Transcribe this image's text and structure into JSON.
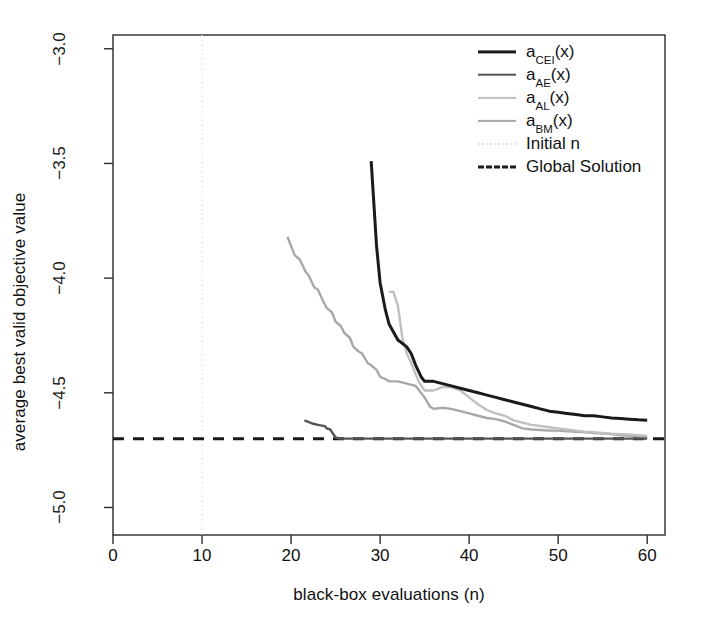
{
  "chart_data": {
    "type": "line",
    "title": "",
    "xlabel": "black-box evaluations (n)",
    "ylabel": "average best valid objective value",
    "xlim": [
      0,
      62
    ],
    "ylim": [
      -5.12,
      -2.94
    ],
    "xticks": [
      0,
      10,
      20,
      30,
      40,
      50,
      60
    ],
    "xtick_labels": [
      "0",
      "10",
      "20",
      "30",
      "40",
      "50",
      "60"
    ],
    "yticks": [
      -3.0,
      -3.5,
      -4.0,
      -4.5,
      -5.0
    ],
    "ytick_labels": [
      "-3.0",
      "-3.5",
      "-4.0",
      "-4.5",
      "-5.0"
    ],
    "grid": false,
    "legend_position": "top-right",
    "colors": {
      "cei": "#1a1a1a",
      "ae": "#555555",
      "al": "#c0c0c0",
      "bm": "#a8a8a8",
      "initial_n": "#e2e2e2",
      "global_solution": "#1a1a1a"
    },
    "annotations": {
      "initial_n_x": 10,
      "global_solution_y": -4.7
    },
    "series": [
      {
        "name": "a_CEI(x)",
        "label_main": "a",
        "label_sub": "CEI",
        "label_tail": "(x)",
        "color": "#1a1a1a",
        "width": 3,
        "dash": "none",
        "points": [
          [
            29,
            -3.49
          ],
          [
            29.6,
            -3.86
          ],
          [
            30,
            -4.02
          ],
          [
            30.6,
            -4.14
          ],
          [
            31,
            -4.2
          ],
          [
            32,
            -4.27
          ],
          [
            33,
            -4.3
          ],
          [
            33.5,
            -4.33
          ],
          [
            34,
            -4.38
          ],
          [
            34.6,
            -4.43
          ],
          [
            35,
            -4.45
          ],
          [
            36,
            -4.45
          ],
          [
            37,
            -4.46
          ],
          [
            38,
            -4.47
          ],
          [
            39,
            -4.48
          ],
          [
            40,
            -4.49
          ],
          [
            41,
            -4.5
          ],
          [
            42,
            -4.51
          ],
          [
            43,
            -4.52
          ],
          [
            44,
            -4.53
          ],
          [
            45,
            -4.54
          ],
          [
            46,
            -4.55
          ],
          [
            47,
            -4.56
          ],
          [
            48,
            -4.57
          ],
          [
            49,
            -4.58
          ],
          [
            50,
            -4.585
          ],
          [
            51,
            -4.59
          ],
          [
            52,
            -4.595
          ],
          [
            53,
            -4.6
          ],
          [
            54,
            -4.6
          ],
          [
            55,
            -4.605
          ],
          [
            56,
            -4.61
          ],
          [
            57,
            -4.612
          ],
          [
            58,
            -4.615
          ],
          [
            59,
            -4.618
          ],
          [
            60,
            -4.62
          ]
        ]
      },
      {
        "name": "a_AE(x)",
        "label_main": "a",
        "label_sub": "AE",
        "label_tail": "(x)",
        "color": "#555555",
        "width": 2.4,
        "dash": "none",
        "points": [
          [
            21.5,
            -4.62
          ],
          [
            22.5,
            -4.635
          ],
          [
            23,
            -4.64
          ],
          [
            23.8,
            -4.645
          ],
          [
            24,
            -4.655
          ],
          [
            24.4,
            -4.66
          ],
          [
            25,
            -4.695
          ],
          [
            25.5,
            -4.7
          ],
          [
            27,
            -4.7
          ],
          [
            30,
            -4.7
          ],
          [
            35,
            -4.7
          ],
          [
            40,
            -4.7
          ],
          [
            45,
            -4.7
          ],
          [
            50,
            -4.7
          ],
          [
            55,
            -4.7
          ],
          [
            60,
            -4.7
          ]
        ]
      },
      {
        "name": "a_AL(x)",
        "label_main": "a",
        "label_sub": "AL",
        "label_tail": "(x)",
        "color": "#c0c0c0",
        "width": 2.4,
        "dash": "none",
        "points": [
          [
            31,
            -4.06
          ],
          [
            31.5,
            -4.06
          ],
          [
            32,
            -4.12
          ],
          [
            32.5,
            -4.26
          ],
          [
            33,
            -4.33
          ],
          [
            33.5,
            -4.37
          ],
          [
            34,
            -4.42
          ],
          [
            34.4,
            -4.455
          ],
          [
            35,
            -4.49
          ],
          [
            36,
            -4.49
          ],
          [
            37,
            -4.475
          ],
          [
            38,
            -4.475
          ],
          [
            39,
            -4.49
          ],
          [
            40,
            -4.52
          ],
          [
            41,
            -4.55
          ],
          [
            42,
            -4.575
          ],
          [
            43,
            -4.59
          ],
          [
            44,
            -4.6
          ],
          [
            45,
            -4.62
          ],
          [
            46,
            -4.63
          ],
          [
            47,
            -4.64
          ],
          [
            48,
            -4.645
          ],
          [
            49,
            -4.65
          ],
          [
            50,
            -4.655
          ],
          [
            51,
            -4.66
          ],
          [
            52,
            -4.665
          ],
          [
            53,
            -4.67
          ],
          [
            54,
            -4.672
          ],
          [
            55,
            -4.675
          ],
          [
            56,
            -4.678
          ],
          [
            57,
            -4.68
          ],
          [
            58,
            -4.682
          ],
          [
            59,
            -4.685
          ],
          [
            60,
            -4.688
          ]
        ]
      },
      {
        "name": "a_BM(x)",
        "label_main": "a",
        "label_sub": "BM",
        "label_tail": "(x)",
        "color": "#a8a8a8",
        "width": 2.4,
        "dash": "none",
        "points": [
          [
            19.6,
            -3.82
          ],
          [
            20.4,
            -3.9
          ],
          [
            21,
            -3.92
          ],
          [
            21.6,
            -3.97
          ],
          [
            22,
            -3.99
          ],
          [
            22.6,
            -4.04
          ],
          [
            23,
            -4.05
          ],
          [
            23.6,
            -4.1
          ],
          [
            24,
            -4.13
          ],
          [
            24.6,
            -4.15
          ],
          [
            25,
            -4.19
          ],
          [
            25.6,
            -4.21
          ],
          [
            26,
            -4.24
          ],
          [
            26.6,
            -4.26
          ],
          [
            27,
            -4.3
          ],
          [
            27.6,
            -4.32
          ],
          [
            28,
            -4.33
          ],
          [
            28.6,
            -4.37
          ],
          [
            29,
            -4.38
          ],
          [
            29.6,
            -4.4
          ],
          [
            30,
            -4.43
          ],
          [
            30.6,
            -4.44
          ],
          [
            31,
            -4.45
          ],
          [
            32,
            -4.45
          ],
          [
            33,
            -4.46
          ],
          [
            34,
            -4.47
          ],
          [
            35,
            -4.52
          ],
          [
            35.6,
            -4.56
          ],
          [
            36,
            -4.57
          ],
          [
            37,
            -4.565
          ],
          [
            38,
            -4.57
          ],
          [
            39,
            -4.58
          ],
          [
            40,
            -4.59
          ],
          [
            41,
            -4.6
          ],
          [
            42,
            -4.61
          ],
          [
            43,
            -4.615
          ],
          [
            44,
            -4.625
          ],
          [
            45,
            -4.64
          ],
          [
            46,
            -4.655
          ],
          [
            47,
            -4.66
          ],
          [
            48,
            -4.662
          ],
          [
            49,
            -4.665
          ],
          [
            50,
            -4.665
          ],
          [
            51,
            -4.668
          ],
          [
            52,
            -4.67
          ],
          [
            53,
            -4.672
          ],
          [
            54,
            -4.675
          ],
          [
            55,
            -4.678
          ],
          [
            56,
            -4.68
          ],
          [
            57,
            -4.685
          ],
          [
            58,
            -4.688
          ],
          [
            59,
            -4.69
          ],
          [
            60,
            -4.692
          ]
        ]
      }
    ],
    "reference_lines": [
      {
        "name": "Initial n",
        "orientation": "vertical",
        "value": 10,
        "color": "#e2e2e2",
        "dash": "dotted",
        "legend_label": "Initial n"
      },
      {
        "name": "Global Solution",
        "orientation": "horizontal",
        "value": -4.7,
        "color": "#1a1a1a",
        "dash": "dashed",
        "legend_label": "Global Solution"
      }
    ]
  },
  "legend": {
    "items": [
      {
        "label": "a_CEI(x)",
        "main": "a",
        "sub": "CEI",
        "tail": "(x)",
        "type": "series"
      },
      {
        "label": "a_AE(x)",
        "main": "a",
        "sub": "AE",
        "tail": "(x)",
        "type": "series"
      },
      {
        "label": "a_AL(x)",
        "main": "a",
        "sub": "AL",
        "tail": "(x)",
        "type": "series"
      },
      {
        "label": "a_BM(x)",
        "main": "a",
        "sub": "BM",
        "tail": "(x)",
        "type": "series"
      },
      {
        "label": "Initial n",
        "main": "Initial n",
        "sub": "",
        "tail": "",
        "type": "reference"
      },
      {
        "label": "Global Solution",
        "main": "Global Solution",
        "sub": "",
        "tail": "",
        "type": "reference"
      }
    ]
  },
  "axes": {
    "x_title": "black-box evaluations (n)",
    "y_title": "average best valid objective value"
  }
}
